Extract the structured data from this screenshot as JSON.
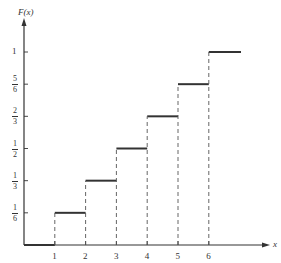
{
  "chart_data": {
    "type": "line",
    "subtype": "step",
    "title": "",
    "xlabel": "x",
    "ylabel": "F(x)",
    "x_ticks": [
      "1",
      "2",
      "3",
      "4",
      "5",
      "6"
    ],
    "y_ticks": [
      {
        "value": 0.1667,
        "num": "1",
        "den": "6"
      },
      {
        "value": 0.3333,
        "num": "1",
        "den": "3"
      },
      {
        "value": 0.5,
        "num": "1",
        "den": "2"
      },
      {
        "value": 0.6667,
        "num": "2",
        "den": "3"
      },
      {
        "value": 0.8333,
        "num": "5",
        "den": "6"
      },
      {
        "value": 1,
        "label": "1"
      }
    ],
    "steps": [
      {
        "x_start": 0,
        "x_end": 1,
        "y": 0
      },
      {
        "x_start": 1,
        "x_end": 2,
        "y": 0.1667
      },
      {
        "x_start": 2,
        "x_end": 3,
        "y": 0.3333
      },
      {
        "x_start": 3,
        "x_end": 4,
        "y": 0.5
      },
      {
        "x_start": 4,
        "x_end": 5,
        "y": 0.6667
      },
      {
        "x_start": 5,
        "x_end": 6,
        "y": 0.8333
      },
      {
        "x_start": 6,
        "x_end": 7,
        "y": 1
      }
    ],
    "jump_lines": "dashed",
    "xlim": [
      0,
      7
    ],
    "ylim": [
      0,
      1
    ],
    "grid": false,
    "legend": null
  },
  "axes": {
    "y_label": "F(x)",
    "x_label": "x"
  }
}
